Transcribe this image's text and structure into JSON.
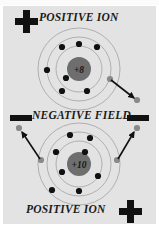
{
  "figure": {
    "background_color": "#ffffff",
    "panel_color": "#e3e3e3"
  },
  "labels": {
    "positive_ion_top": "POSITIVE ION",
    "negative_field": "NEGATIVE FIELD",
    "positive_ion_bottom": "POSITIVE ION"
  },
  "signs": {
    "plus_top": "+",
    "plus_bottom": "+",
    "minus_left": "−",
    "minus_right": "−"
  },
  "colors": {
    "nucleus": "#6e6e6e",
    "nucleus_text": "#1b1b1b",
    "electron_bound": "#111111",
    "electron_free": "#8a8a8a",
    "orbit_stroke": "#a9a9a9",
    "arrow": "#111111",
    "sign": "#111111",
    "text": "#1b1b1b"
  },
  "atoms": [
    {
      "id": "atom-top",
      "nucleus_label": "+8",
      "center": {
        "x": 79,
        "y": 69
      },
      "nucleus_radius": 12,
      "orbits": [
        {
          "name": "inner-orbit",
          "radius": 23
        },
        {
          "name": "middle-orbit",
          "radius": 32
        },
        {
          "name": "outer-orbit",
          "radius": 41
        }
      ],
      "bound_electrons": [
        {
          "x": 62,
          "y": 47
        },
        {
          "x": 79,
          "y": 44
        },
        {
          "x": 97,
          "y": 47
        },
        {
          "x": 47,
          "y": 70
        },
        {
          "x": 66,
          "y": 78
        },
        {
          "x": 62,
          "y": 91
        },
        {
          "x": 87,
          "y": 91
        }
      ],
      "free_electrons": [
        {
          "x": 110,
          "y": 79,
          "name": "escaping-electron-start"
        },
        {
          "x": 137,
          "y": 100,
          "name": "escaping-electron-end"
        }
      ],
      "arrows": [
        {
          "name": "electron-escape-arrow",
          "x1": 111,
          "y1": 80,
          "x2": 134,
          "y2": 98
        }
      ]
    },
    {
      "id": "atom-bottom",
      "nucleus_label": "+10",
      "center": {
        "x": 79,
        "y": 164
      },
      "nucleus_radius": 12,
      "orbits": [
        {
          "name": "inner-orbit",
          "radius": 23
        },
        {
          "name": "middle-orbit",
          "radius": 32
        },
        {
          "name": "outer-orbit",
          "radius": 41
        }
      ],
      "bound_electrons": [
        {
          "x": 70,
          "y": 135
        },
        {
          "x": 90,
          "y": 138
        },
        {
          "x": 56,
          "y": 152
        },
        {
          "x": 85,
          "y": 152
        },
        {
          "x": 62,
          "y": 172
        },
        {
          "x": 98,
          "y": 176
        },
        {
          "x": 52,
          "y": 190
        },
        {
          "x": 79,
          "y": 191
        }
      ],
      "free_electrons": [
        {
          "x": 41,
          "y": 160,
          "name": "escaping-electron-left-start"
        },
        {
          "x": 19,
          "y": 128,
          "name": "escaping-electron-left-end"
        },
        {
          "x": 117,
          "y": 160,
          "name": "escaping-electron-right-start"
        },
        {
          "x": 137,
          "y": 128,
          "name": "escaping-electron-right-end"
        }
      ],
      "arrows": [
        {
          "name": "electron-escape-arrow-left",
          "x1": 40,
          "y1": 159,
          "x2": 22,
          "y2": 131
        },
        {
          "name": "electron-escape-arrow-right",
          "x1": 118,
          "y1": 159,
          "x2": 134,
          "y2": 131
        }
      ]
    }
  ]
}
